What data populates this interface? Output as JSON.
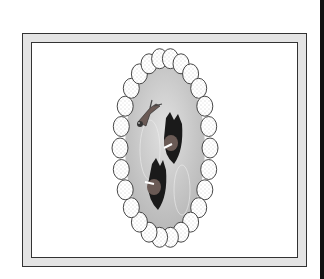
{
  "figure": {
    "colors": {
      "frame_border": "#333333",
      "frame_fill": "#e4e4e4",
      "pond": "#c8c8c8",
      "stone_fill": "#ffffff",
      "stone_stroke": "#333333",
      "animal_dark": "#1a1a1a",
      "animal_body": "#6a5a55",
      "right_bar": "#111111"
    },
    "pond": {
      "cx": 165,
      "cy": 148,
      "rx": 38,
      "ry": 82
    },
    "stones": {
      "count": 26,
      "ring_rx": 45,
      "ring_ry": 90,
      "stone_rx": 8,
      "stone_ry": 10
    },
    "animals": [
      {
        "name": "bird",
        "x": 145,
        "y": 115
      },
      {
        "name": "creature-upper",
        "x": 172,
        "y": 140
      },
      {
        "name": "creature-lower",
        "x": 155,
        "y": 180
      }
    ]
  }
}
